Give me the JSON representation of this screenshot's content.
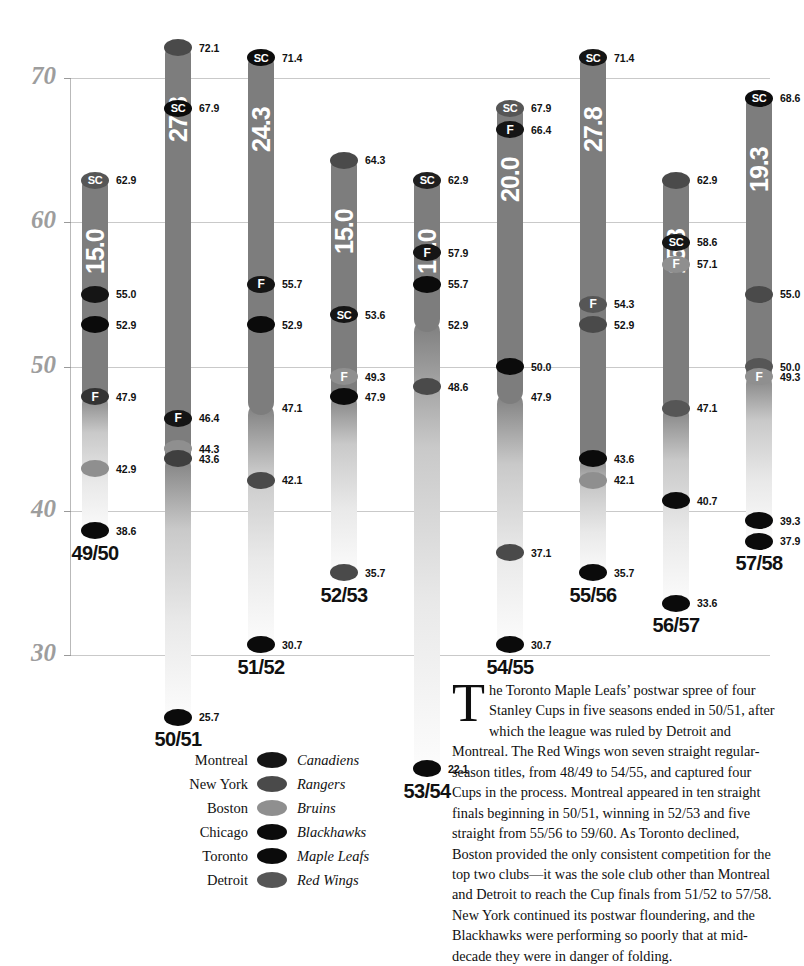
{
  "chart_data": {
    "type": "bar",
    "title": "",
    "xlabel": "",
    "ylabel": "",
    "ylim": [
      30,
      70
    ],
    "yticks": [
      70,
      60,
      50,
      40,
      30
    ],
    "grid": true,
    "legend_position": "bottom-center",
    "categories": [
      "49/50",
      "50/51",
      "51/52",
      "52/53",
      "53/54",
      "54/55",
      "55/56",
      "56/57",
      "57/58"
    ],
    "pct_labels": [
      "15.0",
      "27.8",
      "24.3",
      "15.0",
      "10.0",
      "20.0",
      "27.8",
      "15.8",
      "19.3"
    ],
    "series": [
      {
        "name": "Montreal Canadiens",
        "color": "#151515"
      },
      {
        "name": "New York Rangers",
        "color": "#4a4a4a"
      },
      {
        "name": "Boston Bruins",
        "color": "#8f8f8f"
      },
      {
        "name": "Chicago Blackhawks",
        "color": "#0b0b0b"
      },
      {
        "name": "Toronto Maple Leafs",
        "color": "#0b0b0b"
      },
      {
        "name": "Detroit Red Wings",
        "color": "#565656"
      }
    ],
    "columns": [
      {
        "season": "49/50",
        "pct": "15.0",
        "top": 62.9,
        "bottom": 38.6,
        "solid_to": 47.9,
        "markers": [
          {
            "v": 62.9,
            "label": "62.9",
            "team": "Detroit Red Wings",
            "color": "#565656",
            "badge": "SC"
          },
          {
            "v": 55.0,
            "label": "55.0",
            "team": "Montreal Canadiens",
            "color": "#151515",
            "badge": ""
          },
          {
            "v": 52.9,
            "label": "52.9",
            "team": "Toronto Maple Leafs",
            "color": "#0b0b0b",
            "badge": ""
          },
          {
            "v": 47.9,
            "label": "47.9",
            "team": "New York Rangers",
            "color": "#333333",
            "badge": "F"
          },
          {
            "v": 42.9,
            "label": "42.9",
            "team": "Boston Bruins",
            "color": "#8f8f8f",
            "badge": ""
          },
          {
            "v": 38.6,
            "label": "38.6",
            "team": "Chicago Blackhawks",
            "color": "#0b0b0b",
            "badge": ""
          }
        ]
      },
      {
        "season": "50/51",
        "pct": "27.8",
        "top": 72.1,
        "bottom": 25.7,
        "solid_to": 43.6,
        "markers": [
          {
            "v": 72.1,
            "label": "72.1",
            "team": "Detroit Red Wings",
            "color": "#4a4a4a",
            "badge": ""
          },
          {
            "v": 67.9,
            "label": "67.9",
            "team": "Toronto Maple Leafs",
            "color": "#0b0b0b",
            "badge": "SC"
          },
          {
            "v": 46.4,
            "label": "46.4",
            "team": "Montreal Canadiens",
            "color": "#151515",
            "badge": "F"
          },
          {
            "v": 44.3,
            "label": "44.3",
            "team": "Boston Bruins",
            "color": "#8f8f8f",
            "badge": ""
          },
          {
            "v": 43.6,
            "label": "43.6",
            "team": "New York Rangers",
            "color": "#3f3f3f",
            "badge": ""
          },
          {
            "v": 25.7,
            "label": "25.7",
            "team": "Chicago Blackhawks",
            "color": "#0b0b0b",
            "badge": ""
          }
        ]
      },
      {
        "season": "51/52",
        "pct": "24.3",
        "top": 71.4,
        "bottom": 30.7,
        "solid_to": 47.1,
        "markers": [
          {
            "v": 71.4,
            "label": "71.4",
            "team": "Detroit Red Wings",
            "color": "#0d0d0d",
            "badge": "SC"
          },
          {
            "v": 55.7,
            "label": "55.7",
            "team": "Montreal Canadiens",
            "color": "#151515",
            "badge": "F"
          },
          {
            "v": 52.9,
            "label": "52.9",
            "team": "Toronto Maple Leafs",
            "color": "#0b0b0b",
            "badge": ""
          },
          {
            "v": 47.1,
            "label": "47.1",
            "team": "",
            "color": "",
            "badge": ""
          },
          {
            "v": 42.1,
            "label": "42.1",
            "team": "Boston Bruins",
            "color": "#4a4a4a",
            "badge": ""
          },
          {
            "v": 30.7,
            "label": "30.7",
            "team": "Chicago Blackhawks",
            "color": "#0b0b0b",
            "badge": ""
          }
        ]
      },
      {
        "season": "52/53",
        "pct": "15.0",
        "top": 64.3,
        "bottom": 35.7,
        "solid_to": 47.9,
        "markers": [
          {
            "v": 64.3,
            "label": "64.3",
            "team": "Detroit Red Wings",
            "color": "#4a4a4a",
            "badge": ""
          },
          {
            "v": 53.6,
            "label": "53.6",
            "team": "Montreal Canadiens",
            "color": "#151515",
            "badge": "SC"
          },
          {
            "v": 49.3,
            "label": "49.3",
            "team": "Boston Bruins",
            "color": "#8f8f8f",
            "badge": "F"
          },
          {
            "v": 47.9,
            "label": "47.9",
            "team": "Chicago Blackhawks",
            "color": "#0b0b0b",
            "badge": ""
          },
          {
            "v": 35.7,
            "label": "35.7",
            "team": "New York Rangers",
            "color": "#4a4a4a",
            "badge": ""
          }
        ]
      },
      {
        "season": "53/54",
        "pct": "10.0",
        "top": 62.9,
        "bottom": 22.1,
        "solid_to": 52.9,
        "markers": [
          {
            "v": 62.9,
            "label": "62.9",
            "team": "Detroit Red Wings",
            "color": "#1f1f1f",
            "badge": "SC"
          },
          {
            "v": 57.9,
            "label": "57.9",
            "team": "Montreal Canadiens",
            "color": "#151515",
            "badge": "F"
          },
          {
            "v": 55.7,
            "label": "55.7",
            "team": "Toronto Maple Leafs",
            "color": "#0b0b0b",
            "badge": ""
          },
          {
            "v": 52.9,
            "label": "52.9",
            "team": "",
            "color": "",
            "badge": ""
          },
          {
            "v": 48.6,
            "label": "48.6",
            "team": "Boston Bruins",
            "color": "#4a4a4a",
            "badge": ""
          },
          {
            "v": 22.1,
            "label": "22.1",
            "team": "Chicago Blackhawks",
            "color": "#0b0b0b",
            "badge": ""
          }
        ]
      },
      {
        "season": "54/55",
        "pct": "20.0",
        "top": 67.9,
        "bottom": 30.7,
        "solid_to": 47.9,
        "markers": [
          {
            "v": 67.9,
            "label": "67.9",
            "team": "Detroit Red Wings",
            "color": "#565656",
            "badge": "SC"
          },
          {
            "v": 66.4,
            "label": "66.4",
            "team": "Montreal Canadiens",
            "color": "#151515",
            "badge": "F"
          },
          {
            "v": 50.0,
            "label": "50.0",
            "team": "Toronto Maple Leafs",
            "color": "#0b0b0b",
            "badge": ""
          },
          {
            "v": 47.9,
            "label": "47.9",
            "team": "",
            "color": "",
            "badge": ""
          },
          {
            "v": 37.1,
            "label": "37.1",
            "team": "New York Rangers",
            "color": "#4a4a4a",
            "badge": ""
          },
          {
            "v": 30.7,
            "label": "30.7",
            "team": "Chicago Blackhawks",
            "color": "#0b0b0b",
            "badge": ""
          }
        ]
      },
      {
        "season": "55/56",
        "pct": "27.8",
        "top": 71.4,
        "bottom": 35.7,
        "solid_to": 43.6,
        "markers": [
          {
            "v": 71.4,
            "label": "71.4",
            "team": "Montreal Canadiens",
            "color": "#151515",
            "badge": "SC"
          },
          {
            "v": 54.3,
            "label": "54.3",
            "team": "Detroit Red Wings",
            "color": "#565656",
            "badge": "F"
          },
          {
            "v": 52.9,
            "label": "52.9",
            "team": "New York Rangers",
            "color": "#4a4a4a",
            "badge": ""
          },
          {
            "v": 43.6,
            "label": "43.6",
            "team": "Toronto Maple Leafs",
            "color": "#0b0b0b",
            "badge": ""
          },
          {
            "v": 42.1,
            "label": "42.1",
            "team": "Boston Bruins",
            "color": "#8f8f8f",
            "badge": ""
          },
          {
            "v": 35.7,
            "label": "35.7",
            "team": "Chicago Blackhawks",
            "color": "#0b0b0b",
            "badge": ""
          }
        ]
      },
      {
        "season": "56/57",
        "pct": "15.8",
        "top": 62.9,
        "bottom": 33.6,
        "solid_to": 47.1,
        "markers": [
          {
            "v": 62.9,
            "label": "62.9",
            "team": "Detroit Red Wings",
            "color": "#4a4a4a",
            "badge": ""
          },
          {
            "v": 58.6,
            "label": "58.6",
            "team": "Montreal Canadiens",
            "color": "#151515",
            "badge": "SC"
          },
          {
            "v": 57.1,
            "label": "57.1",
            "team": "Boston Bruins",
            "color": "#8f8f8f",
            "badge": "F"
          },
          {
            "v": 47.1,
            "label": "47.1",
            "team": "New York Rangers",
            "color": "#565656",
            "badge": ""
          },
          {
            "v": 40.7,
            "label": "40.7",
            "team": "Toronto Maple Leafs",
            "color": "#0b0b0b",
            "badge": ""
          },
          {
            "v": 33.6,
            "label": "33.6",
            "team": "Chicago Blackhawks",
            "color": "#0b0b0b",
            "badge": ""
          }
        ]
      },
      {
        "season": "57/58",
        "pct": "19.3",
        "top": 68.6,
        "bottom": 37.9,
        "solid_to": 49.3,
        "markers": [
          {
            "v": 68.6,
            "label": "68.6",
            "team": "Montreal Canadiens",
            "color": "#0d0d0d",
            "badge": "SC"
          },
          {
            "v": 55.0,
            "label": "55.0",
            "team": "New York Rangers",
            "color": "#4a4a4a",
            "badge": ""
          },
          {
            "v": 50.0,
            "label": "50.0",
            "team": "Detroit Red Wings",
            "color": "#565656",
            "badge": ""
          },
          {
            "v": 49.3,
            "label": "49.3",
            "team": "Boston Bruins",
            "color": "#8f8f8f",
            "badge": "F"
          },
          {
            "v": 39.3,
            "label": "39.3",
            "team": "Chicago Blackhawks",
            "color": "#0b0b0b",
            "badge": ""
          },
          {
            "v": 37.9,
            "label": "37.9",
            "team": "Toronto Maple Leafs",
            "color": "#0b0b0b",
            "badge": ""
          }
        ]
      }
    ]
  },
  "legend": {
    "rows": [
      {
        "city": "Montreal",
        "team": "Canadiens",
        "color": "#151515"
      },
      {
        "city": "New York",
        "team": "Rangers",
        "color": "#4a4a4a"
      },
      {
        "city": "Boston",
        "team": "Bruins",
        "color": "#8f8f8f"
      },
      {
        "city": "Chicago",
        "team": "Blackhawks",
        "color": "#0b0b0b"
      },
      {
        "city": "Toronto",
        "team": "Maple Leafs",
        "color": "#0b0b0b"
      },
      {
        "city": "Detroit",
        "team": "Red Wings",
        "color": "#565656"
      }
    ]
  },
  "prose": {
    "dropcap": "T",
    "body": "he Toronto Maple Leafs’ postwar spree of four Stanley Cups in five seasons ended in 50/51, after which the league was ruled by Detroit and Montreal. The Red Wings won seven straight regular-season titles, from 48/49 to 54/55, and captured four Cups in the process. Montreal appeared in ten straight finals beginning in 50/51, winning in 52/53 and five straight from 55/56 to 59/60. As Toronto declined, Boston provided the only consistent competition for the top two clubs—it was the sole club other than Montreal and Detroit to reach the Cup finals from 51/52 to 57/58. New York continued its postwar floundering, and the Blackhawks were performing so poorly that at mid-decade they were in danger of folding."
  },
  "badges": {
    "sc": "SC",
    "f": "F"
  }
}
